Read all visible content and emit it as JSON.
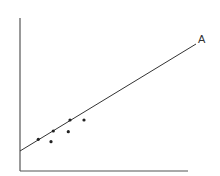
{
  "chart_data": {
    "type": "scatter",
    "title": "",
    "xlabel": "",
    "ylabel": "",
    "grid": false,
    "legend": null,
    "points": [
      {
        "x": 38.3,
        "y": 139.3
      },
      {
        "x": 51,
        "y": 141.7
      },
      {
        "x": 53.3,
        "y": 131
      },
      {
        "x": 68.3,
        "y": 131.7
      },
      {
        "x": 70,
        "y": 120
      },
      {
        "x": 84,
        "y": 120
      }
    ],
    "trend_line": {
      "x1": 20,
      "y1": 151,
      "x2": 196,
      "y2": 44,
      "label": "A"
    },
    "axes": {
      "origin_x": 20,
      "origin_y": 171,
      "y_top": 18,
      "x_right": 188
    },
    "colors": {
      "axis": "#555555",
      "line": "#333333",
      "point": "#222222"
    }
  },
  "annotations": {
    "line_label": "A"
  }
}
